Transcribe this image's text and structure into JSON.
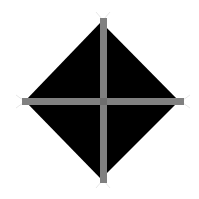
{
  "diagram": {
    "shape": "diamond-with-cross",
    "colors": {
      "background": "#ffffff",
      "diamond_fill": "#000000",
      "cross_bar": "#808080",
      "cross_center": "#6e6e6e",
      "end_marks": "#e6e6e6"
    },
    "diamond": {
      "top": [
        101,
        22
      ],
      "right": [
        179,
        101
      ],
      "bottom": [
        101,
        179
      ],
      "left": [
        25,
        101
      ]
    },
    "vertical_bar": {
      "x": 100,
      "y": 18,
      "width": 7,
      "height": 165
    },
    "horizontal_bar": {
      "x": 22,
      "y": 98,
      "width": 162,
      "height": 7
    }
  }
}
